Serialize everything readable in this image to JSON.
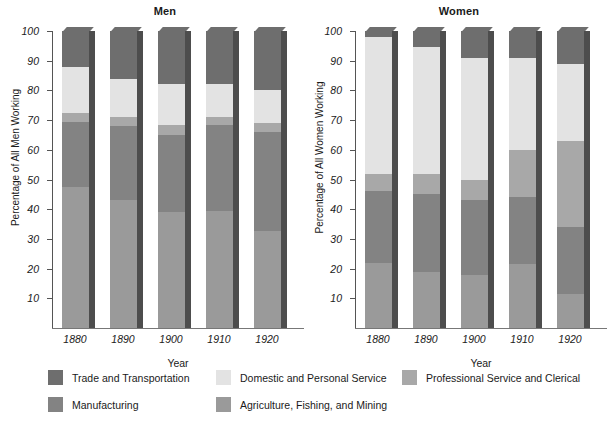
{
  "chart_data": {
    "type": "bar",
    "subtype": "stacked-percentage",
    "panels": [
      {
        "title": "Men",
        "ylabel": "Percentage of All Men Working",
        "xlabel": "Year",
        "categories": [
          "1880",
          "1890",
          "1900",
          "1910",
          "1920"
        ],
        "ylim": [
          0,
          100
        ],
        "yticks": [
          10,
          20,
          30,
          40,
          50,
          60,
          70,
          80,
          90,
          100
        ],
        "grid": false,
        "series": [
          {
            "name": "Agriculture, Fishing, and Mining",
            "values": [
              47.5,
              43,
              39,
              39.5,
              32.5
            ]
          },
          {
            "name": "Manufacturing",
            "values": [
              22,
              25,
              26,
              29,
              33.5
            ]
          },
          {
            "name": "Professional Service and Clerical",
            "values": [
              3,
              3,
              3.5,
              2.5,
              3
            ]
          },
          {
            "name": "Domestic and Personal Service",
            "values": [
              15.5,
              13,
              13.5,
              11,
              11
            ]
          },
          {
            "name": "Trade and Transportation",
            "values": [
              12,
              16,
              18,
              18,
              20
            ]
          }
        ]
      },
      {
        "title": "Women",
        "ylabel": "Percentage of All Women Working",
        "xlabel": "Year",
        "categories": [
          "1880",
          "1890",
          "1900",
          "1910",
          "1920"
        ],
        "ylim": [
          0,
          100
        ],
        "yticks": [
          10,
          20,
          30,
          40,
          50,
          60,
          70,
          80,
          90,
          100
        ],
        "grid": false,
        "series": [
          {
            "name": "Agriculture, Fishing, and Mining",
            "values": [
              22,
              19,
              18,
              21.5,
              11.5
            ]
          },
          {
            "name": "Manufacturing",
            "values": [
              24,
              26,
              25,
              22.5,
              22.5
            ]
          },
          {
            "name": "Professional Service and Clerical",
            "values": [
              6,
              7,
              7,
              16,
              29
            ]
          },
          {
            "name": "Domestic and Personal Service",
            "values": [
              46,
              42.5,
              41,
              31,
              26
            ]
          },
          {
            "name": "Trade and Transportation",
            "values": [
              2,
              5.5,
              9,
              9,
              11
            ]
          }
        ]
      }
    ],
    "legend": {
      "position": "bottom",
      "entries": [
        {
          "label": "Trade and Transportation",
          "color": "#6e6e6e",
          "row": 0,
          "col": 0
        },
        {
          "label": "Domestic and Personal Service",
          "color": "#e3e3e3",
          "row": 0,
          "col": 1
        },
        {
          "label": "Professional Service and Clerical",
          "color": "#a8a8a8",
          "row": 0,
          "col": 2
        },
        {
          "label": "Manufacturing",
          "color": "#838383",
          "row": 1,
          "col": 0
        },
        {
          "label": "Agriculture, Fishing, and Mining",
          "color": "#9a9a9a",
          "row": 1,
          "col": 1
        }
      ]
    },
    "colors": {
      "trade": "#6e6e6e",
      "domestic": "#e3e3e3",
      "professional": "#a8a8a8",
      "manufacturing": "#838383",
      "agriculture": "#9a9a9a",
      "bar_side_shadow": "#4d4d4d",
      "axis": "#555555",
      "background": "#ffffff"
    }
  }
}
